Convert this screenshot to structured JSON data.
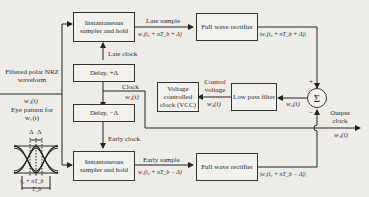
{
  "diagram": {
    "type": "block-diagram",
    "blocks": {
      "sampler_late": "Instantaneous sampler and hold",
      "sampler_early": "Instantaneous sampler and hold",
      "rectifier_late": "Full wave rectifier",
      "rectifier_early": "Full wave rectifier",
      "delay_plus": "Delay, +Δ",
      "delay_minus": "Delay, −Δ",
      "vcc": "Voltage controlled clock (VCC)",
      "lpf": "Low pass filter",
      "summer": "Σ"
    },
    "labels": {
      "input_title": "Filtered polar NRZ waveform",
      "input_signal": "w₁(t)",
      "eye_title": "Eye pattern for w₁(t)",
      "eye_delta_left": "Δ",
      "eye_delta_right": "Δ",
      "eye_center": "τ₀ + nT_b",
      "eye_period": "T_b",
      "late_sample": "Late sample",
      "late_sample_expr": "w₁(t₀ + nT_b + Δ)",
      "late_rect_expr": "|w₁(t₀ + nT_b + Δ)|",
      "early_sample": "Early sample",
      "early_sample_expr": "w₁(t₀ + nT_b − Δ)",
      "early_rect_expr": "|w₁(t₀ + nT_b − Δ)|",
      "late_clock": "Late clock",
      "early_clock": "Early clock",
      "clock": "Clock",
      "clock_signal": "w₄(t)",
      "control_voltage": "Control voltage",
      "w3": "w₃(t)",
      "w2": "w₂(t)",
      "plus": "+",
      "minus": "−",
      "output_clock": "Output clock",
      "output_signal": "w₄(t)"
    }
  }
}
